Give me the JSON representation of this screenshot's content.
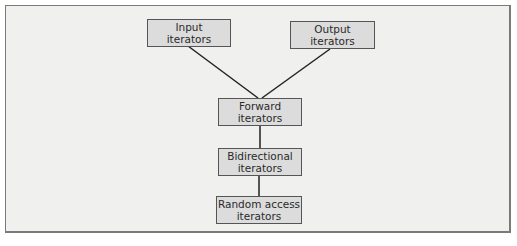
{
  "diagram": {
    "nodes": {
      "input": {
        "line1": "Input",
        "line2": "iterators"
      },
      "output": {
        "line1": "Output",
        "line2": "iterators"
      },
      "forward": {
        "line1": "Forward",
        "line2": "iterators"
      },
      "bidirectional": {
        "line1": "Bidirectional",
        "line2": "iterators"
      },
      "random_access": {
        "line1": "Random access",
        "line2": "iterators"
      }
    },
    "edges": [
      {
        "from": "input",
        "to": "forward"
      },
      {
        "from": "output",
        "to": "forward"
      },
      {
        "from": "forward",
        "to": "bidirectional"
      },
      {
        "from": "bidirectional",
        "to": "random_access"
      }
    ],
    "colors": {
      "background": "#f0f0ef",
      "node_fill": "#dcdcdc",
      "border": "#555555",
      "line": "#222222"
    }
  }
}
